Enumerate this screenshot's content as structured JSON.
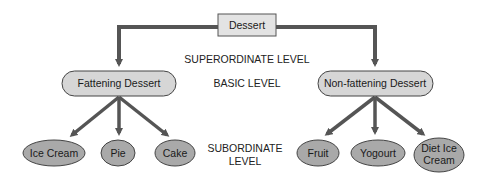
{
  "diagram": {
    "root": {
      "label": "Dessert"
    },
    "levels": {
      "superordinate": "SUPERORDINATE LEVEL",
      "basic": "BASIC LEVEL",
      "subordinate_line1": "SUBORDINATE",
      "subordinate_line2": "LEVEL"
    },
    "basic": [
      {
        "label": "Fattening Dessert"
      },
      {
        "label": "Non-fattening Dessert"
      }
    ],
    "subordinate": [
      {
        "label": "Ice Cream"
      },
      {
        "label": "Pie"
      },
      {
        "label": "Cake"
      },
      {
        "label": "Fruit"
      },
      {
        "label": "Yogourt"
      },
      {
        "label_line1": "Diet Ice",
        "label_line2": "Cream"
      }
    ],
    "colors": {
      "arrow": "#555555",
      "root_fill": "#e3e3e3",
      "basic_fill": "#d6d6d6",
      "sub_fill": "#a9a9a9",
      "stroke": "#444444"
    }
  }
}
